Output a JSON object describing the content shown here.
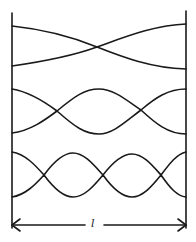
{
  "diagram": {
    "type": "standing-wave-modes",
    "stroke_color": "#1a1a1a",
    "background": "#ffffff",
    "walls": {
      "left_x": 12,
      "right_x": 186,
      "top_y": 13,
      "bottom_y": 228
    },
    "modes": [
      {
        "name": "mode-1",
        "loops": 1,
        "top_y": 25,
        "bottom_y": 68,
        "curve_a": "M12,26 C50,30 80,40 97,47 C120,56 150,68 186,69",
        "curve_b": "M12,66 C40,62 75,55 97,47 C125,37 155,25 186,24"
      },
      {
        "name": "mode-2",
        "loops": 2,
        "top_y": 89,
        "bottom_y": 134,
        "curve_a": "M12,89 C30,92 45,102 57,111 C75,96 85,89 99,89 C113,89 125,99 141,110 C155,98 168,89 186,89",
        "curve_b": "M12,133 C30,131 45,120 57,111 C75,127 85,134 99,134 C113,134 125,122 141,110 C155,123 168,134 186,134"
      },
      {
        "name": "mode-3",
        "loops": 3,
        "top_y": 152,
        "bottom_y": 197,
        "curve_a": "M12,152 C25,154 35,165 44,175 C55,160 64,153 73,153 C84,153 93,164 103,175 C113,162 122,154 132,154 C143,154 152,165 161,175 C170,163 177,154 186,152",
        "curve_b": "M12,197 C25,195 35,185 44,175 C55,190 64,197 73,197 C84,197 93,187 103,175 C113,189 122,197 132,197 C143,197 152,186 161,175 C170,188 177,196 186,197"
      }
    ],
    "dimension": {
      "label": "l",
      "y": 225,
      "x_start": 12,
      "x_end": 186,
      "gap_start": 85,
      "gap_end": 104,
      "label_x": 90,
      "label_y": 218
    }
  }
}
